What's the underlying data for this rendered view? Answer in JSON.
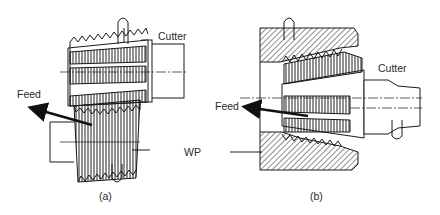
{
  "figure": {
    "panel_a": {
      "caption": "(a)",
      "labels": {
        "cutter": "Cutter",
        "feed": "Feed",
        "workpiece": "WP"
      }
    },
    "panel_b": {
      "caption": "(b)",
      "labels": {
        "cutter": "Cutter",
        "feed": "Feed"
      }
    },
    "colors": {
      "line": "#1a1a1a",
      "background": "#ffffff"
    }
  }
}
